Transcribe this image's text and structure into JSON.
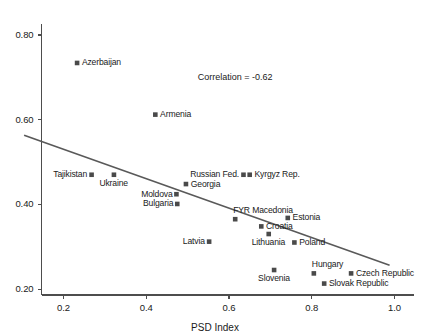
{
  "chart_data": {
    "type": "scatter",
    "title": "",
    "subtitle": "",
    "xlabel": "PSD Index",
    "ylabel": "",
    "xlim": [
      0.147,
      1.047
    ],
    "ylim": [
      0.186,
      0.826
    ],
    "grid": false,
    "legend": false,
    "xticks": [
      0.2,
      0.4,
      0.6,
      0.8,
      1.0
    ],
    "xticklabels": [
      "0.2",
      "0.4",
      "0.6",
      "0.8",
      "1.0"
    ],
    "yticks": [
      0.2,
      0.4,
      0.6,
      0.8
    ],
    "yticklabels": [
      "0.20",
      "0.40",
      "0.60",
      "0.80"
    ],
    "annotations": [
      {
        "text": "Correlation = -0.62",
        "x": 0.615,
        "y": 0.702
      }
    ],
    "trendline": {
      "x": [
        0.105,
        0.988
      ],
      "y": [
        0.563,
        0.256
      ]
    },
    "points": [
      {
        "label": "Azerbaijan",
        "x": 0.233,
        "y": 0.734,
        "label_pos": "right"
      },
      {
        "label": "Armenia",
        "x": 0.422,
        "y": 0.612,
        "label_pos": "right"
      },
      {
        "label": "Tajikistan",
        "x": 0.268,
        "y": 0.47,
        "label_pos": "left"
      },
      {
        "label": "Ukraine",
        "x": 0.322,
        "y": 0.47,
        "label_pos": "below"
      },
      {
        "label": "Moldova",
        "x": 0.473,
        "y": 0.424,
        "label_pos": "left"
      },
      {
        "label": "Bulgaria",
        "x": 0.475,
        "y": 0.401,
        "label_pos": "left"
      },
      {
        "label": "Georgia",
        "x": 0.496,
        "y": 0.448,
        "label_pos": "right"
      },
      {
        "label": "Russian Fed.",
        "x": 0.635,
        "y": 0.47,
        "label_pos": "left"
      },
      {
        "label": "Kyrgyz Rep.",
        "x": 0.65,
        "y": 0.47,
        "label_pos": "right"
      },
      {
        "label": "FYR Macedonia",
        "x": 0.615,
        "y": 0.365,
        "label_pos": "above"
      },
      {
        "label": "Estonia",
        "x": 0.742,
        "y": 0.368,
        "label_pos": "right"
      },
      {
        "label": "Croatia",
        "x": 0.678,
        "y": 0.348,
        "label_pos": "right"
      },
      {
        "label": "Lithuania",
        "x": 0.696,
        "y": 0.33,
        "label_pos": "below"
      },
      {
        "label": "Poland",
        "x": 0.758,
        "y": 0.31,
        "label_pos": "right"
      },
      {
        "label": "Latvia",
        "x": 0.552,
        "y": 0.312,
        "label_pos": "left"
      },
      {
        "label": "Hungary",
        "x": 0.805,
        "y": 0.237,
        "label_pos": "above"
      },
      {
        "label": "Slovenia",
        "x": 0.709,
        "y": 0.245,
        "label_pos": "below"
      },
      {
        "label": "Czech Republic",
        "x": 0.895,
        "y": 0.237,
        "label_pos": "right"
      },
      {
        "label": "Slovak Republic",
        "x": 0.83,
        "y": 0.213,
        "label_pos": "right"
      }
    ]
  }
}
